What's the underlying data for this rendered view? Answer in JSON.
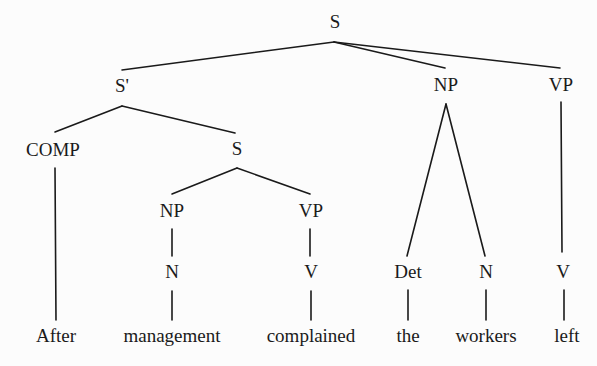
{
  "diagram": {
    "type": "syntax-tree",
    "sentence": "After management complained the workers left",
    "nodes": {
      "root_s": {
        "label": "S",
        "x": 335,
        "y": 24
      },
      "s_bar": {
        "label": "S'",
        "x": 122,
        "y": 88
      },
      "np_main": {
        "label": "NP",
        "x": 446,
        "y": 87
      },
      "vp_main": {
        "label": "VP",
        "x": 561,
        "y": 87
      },
      "comp": {
        "label": "COMP",
        "x": 53,
        "y": 152
      },
      "s_embedded": {
        "label": "S",
        "x": 237,
        "y": 151
      },
      "np_embedded": {
        "label": "NP",
        "x": 172,
        "y": 213
      },
      "vp_embedded": {
        "label": "VP",
        "x": 311,
        "y": 213
      },
      "n_management": {
        "label": "N",
        "x": 172,
        "y": 274
      },
      "v_complained": {
        "label": "V",
        "x": 311,
        "y": 274
      },
      "det_the": {
        "label": "Det",
        "x": 408,
        "y": 274
      },
      "n_workers": {
        "label": "N",
        "x": 486,
        "y": 274
      },
      "v_left": {
        "label": "V",
        "x": 563,
        "y": 274
      }
    },
    "words": {
      "after": {
        "text": "After",
        "x": 56,
        "y": 338
      },
      "management": {
        "text": "management",
        "x": 172,
        "y": 338
      },
      "complained": {
        "text": "complained",
        "x": 311,
        "y": 338
      },
      "the": {
        "text": "the",
        "x": 408,
        "y": 338
      },
      "workers": {
        "text": "workers",
        "x": 486,
        "y": 338
      },
      "left": {
        "text": "left",
        "x": 567,
        "y": 338
      }
    },
    "edges": [
      {
        "from": "S",
        "to": "S'",
        "x1": 334,
        "y1": 42,
        "x2": 122,
        "y2": 70
      },
      {
        "from": "S",
        "to": "NP",
        "x1": 334,
        "y1": 42,
        "x2": 445,
        "y2": 68
      },
      {
        "from": "S",
        "to": "VP",
        "x1": 334,
        "y1": 42,
        "x2": 560,
        "y2": 68
      },
      {
        "from": "S'",
        "to": "COMP",
        "x1": 122,
        "y1": 106,
        "x2": 55,
        "y2": 132
      },
      {
        "from": "S'",
        "to": "S",
        "x1": 122,
        "y1": 106,
        "x2": 235,
        "y2": 133
      },
      {
        "from": "COMP",
        "to": "After",
        "x1": 55,
        "y1": 168,
        "x2": 56,
        "y2": 320
      },
      {
        "from": "S",
        "to": "NP",
        "x1": 237,
        "y1": 168,
        "x2": 172,
        "y2": 194
      },
      {
        "from": "S",
        "to": "VP",
        "x1": 237,
        "y1": 168,
        "x2": 310,
        "y2": 194
      },
      {
        "from": "NP",
        "to": "N",
        "x1": 172,
        "y1": 229,
        "x2": 172,
        "y2": 256
      },
      {
        "from": "VP",
        "to": "V",
        "x1": 310,
        "y1": 229,
        "x2": 310,
        "y2": 256
      },
      {
        "from": "N",
        "to": "management",
        "x1": 172,
        "y1": 291,
        "x2": 172,
        "y2": 320
      },
      {
        "from": "V",
        "to": "complained",
        "x1": 311,
        "y1": 291,
        "x2": 311,
        "y2": 320
      },
      {
        "from": "NP",
        "to": "Det",
        "x1": 446,
        "y1": 104,
        "x2": 407,
        "y2": 256
      },
      {
        "from": "NP",
        "to": "N",
        "x1": 446,
        "y1": 104,
        "x2": 485,
        "y2": 256
      },
      {
        "from": "VP",
        "to": "V",
        "x1": 561,
        "y1": 102,
        "x2": 562,
        "y2": 252
      },
      {
        "from": "Det",
        "to": "the",
        "x1": 408,
        "y1": 290,
        "x2": 408,
        "y2": 320
      },
      {
        "from": "N",
        "to": "workers",
        "x1": 486,
        "y1": 290,
        "x2": 486,
        "y2": 320
      },
      {
        "from": "V",
        "to": "left",
        "x1": 564,
        "y1": 290,
        "x2": 564,
        "y2": 320
      }
    ]
  },
  "colors": {
    "background": "#fcfcfc",
    "ink": "#1a1a1a"
  }
}
